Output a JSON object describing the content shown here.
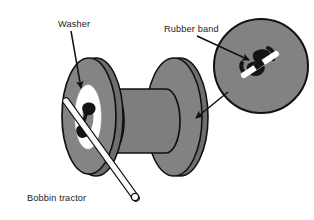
{
  "figure": {
    "title": "Bobbin tractor",
    "background_color": "#ffffff",
    "ink_color": "#111111",
    "body_gray": "#808080",
    "shadow_gray": "#6b6b6b",
    "highlight_white": "#ffffff",
    "labels": {
      "washer": "Washer",
      "rubber_band": "Rubber band",
      "caption": "Bobbin tractor"
    },
    "callouts": [
      {
        "name": "washer-callout",
        "text": "Washer",
        "points_to": "washer-ellipse"
      },
      {
        "name": "rubber-band-callout",
        "text": "Rubber band",
        "points_to": "rubber-band-knot"
      },
      {
        "name": "detail-callout",
        "text": "",
        "points_to": "bobbin-right-flange"
      }
    ],
    "parts": [
      {
        "name": "bobbin-left-flange",
        "shape": "ellipse-disc"
      },
      {
        "name": "bobbin-barrel",
        "shape": "cylinder"
      },
      {
        "name": "bobbin-right-flange",
        "shape": "ellipse-disc"
      },
      {
        "name": "washer-ellipse",
        "shape": "ellipse-ring"
      },
      {
        "name": "rubber-band-knot",
        "shape": "s-knot"
      },
      {
        "name": "tractor-stick",
        "shape": "rod"
      },
      {
        "name": "detail-circle",
        "shape": "circle"
      }
    ]
  }
}
